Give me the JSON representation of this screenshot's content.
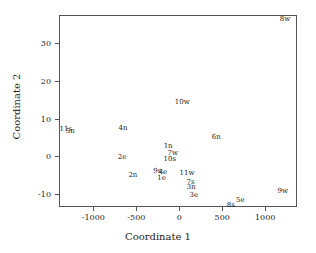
{
  "chart_data": {
    "type": "scatter",
    "title": "",
    "xlabel": "Coordinate 1",
    "ylabel": "Coordinate 2",
    "xlim": [
      -1400,
      1370
    ],
    "ylim": [
      -13.5,
      37.5
    ],
    "xticks": [
      -1000,
      -500,
      0,
      500,
      1000
    ],
    "xticklabels": [
      "-1000",
      "-500",
      "0",
      "500",
      "1000"
    ],
    "yticks": [
      -10,
      0,
      10,
      20,
      30
    ],
    "yticklabels": [
      "-10",
      "0",
      "10",
      "20",
      "30"
    ],
    "grid": false,
    "legend": false,
    "marker": "text-label",
    "points": [
      {
        "label": "8w",
        "x": 1230,
        "y": 36.5
      },
      {
        "label": "10w",
        "x": 35,
        "y": 14.5
      },
      {
        "label": "11s",
        "x": -1320,
        "y": 7.2
      },
      {
        "label": "5n",
        "x": -1270,
        "y": 6.6
      },
      {
        "label": "4n",
        "x": -655,
        "y": 7.5
      },
      {
        "label": "6n",
        "x": 430,
        "y": 5.2
      },
      {
        "label": "1n",
        "x": -130,
        "y": 2.6
      },
      {
        "label": "7w",
        "x": -75,
        "y": 0.9
      },
      {
        "label": "2e",
        "x": -665,
        "y": -0.3
      },
      {
        "label": "10s",
        "x": -110,
        "y": -0.8
      },
      {
        "label": "9s",
        "x": -255,
        "y": -4.0
      },
      {
        "label": "4e",
        "x": -190,
        "y": -4.3
      },
      {
        "label": "2n",
        "x": -540,
        "y": -5.0
      },
      {
        "label": "11w",
        "x": 90,
        "y": -4.4
      },
      {
        "label": "1e",
        "x": -205,
        "y": -5.8
      },
      {
        "label": "7s",
        "x": 130,
        "y": -6.8
      },
      {
        "label": "3n",
        "x": 140,
        "y": -8.3
      },
      {
        "label": "9w",
        "x": 1205,
        "y": -9.2
      },
      {
        "label": "3e",
        "x": 170,
        "y": -10.3
      },
      {
        "label": "5e",
        "x": 710,
        "y": -11.7
      },
      {
        "label": "8s",
        "x": 600,
        "y": -13.0
      }
    ]
  }
}
